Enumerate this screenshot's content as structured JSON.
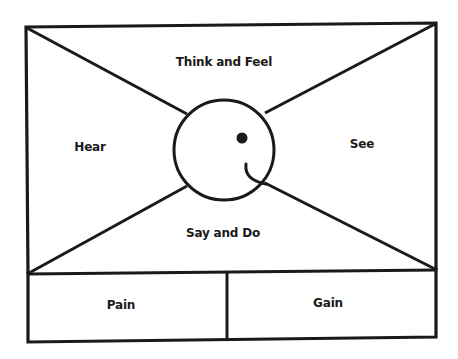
{
  "diagram": {
    "type": "empathy-map",
    "colors": {
      "stroke": "#1a1a1a",
      "background": "#ffffff",
      "text": "#1a1a1a"
    },
    "quadrants": {
      "top": {
        "label": "Think and Feel"
      },
      "left": {
        "label": "Hear"
      },
      "right": {
        "label": "See"
      },
      "bottom": {
        "label": "Say and Do"
      }
    },
    "bottom_panels": {
      "left": {
        "label": "Pain"
      },
      "right": {
        "label": "Gain"
      }
    },
    "center": {
      "icon": "smiley-face-icon"
    }
  }
}
